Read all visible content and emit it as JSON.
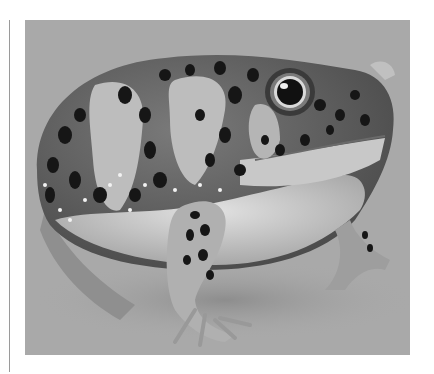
{
  "figure": {
    "alt": "Grayscale illustration of a round, spotted frog with a large eye, sitting on a plain background",
    "colors": {
      "background": "#a9a9a9",
      "body_dark": "#555555",
      "body_mid": "#8a8a8a",
      "patch_light": "#b9b9b9",
      "belly": "#cfcfcf",
      "spot": "#1a1a1a",
      "speck": "#f2f2f2",
      "page": "#ffffff",
      "rule": "#9a9a9a"
    }
  }
}
